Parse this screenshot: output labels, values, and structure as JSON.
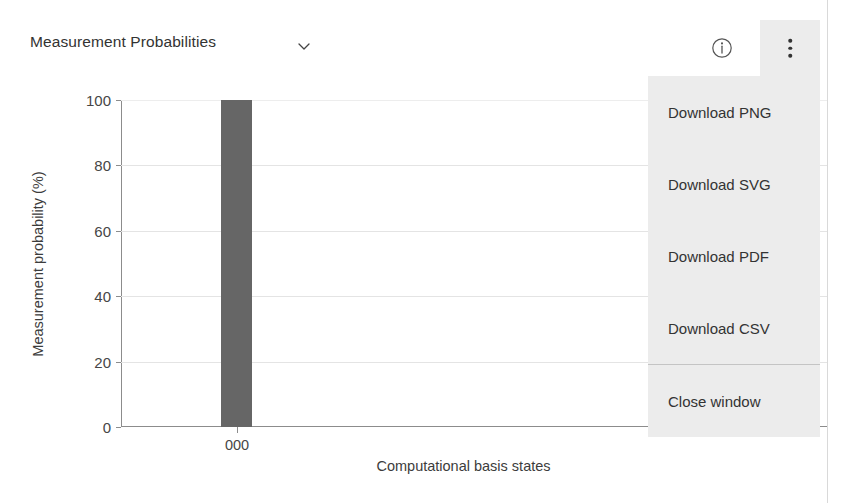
{
  "header": {
    "title": "Measurement Probabilities",
    "chevron_icon": "chevron-down-icon",
    "info_icon": "info-circle-icon",
    "kebab_icon": "more-vertical-icon"
  },
  "menu": {
    "items": [
      {
        "label": "Download PNG",
        "divider_after": false
      },
      {
        "label": "Download SVG",
        "divider_after": false
      },
      {
        "label": "Download PDF",
        "divider_after": false
      },
      {
        "label": "Download CSV",
        "divider_after": true
      },
      {
        "label": "Close window",
        "divider_after": false
      }
    ]
  },
  "chart_data": {
    "type": "bar",
    "title": "Measurement Probabilities",
    "categories": [
      "000"
    ],
    "values": [
      100
    ],
    "xlabel": "Computational basis states",
    "ylabel": "Measurement probability (%)",
    "ylim": [
      0,
      100
    ],
    "yticks": [
      0,
      20,
      40,
      60,
      80,
      100
    ],
    "yticklabels": [
      "0",
      "20",
      "40",
      "60",
      "80",
      "100"
    ],
    "grid": true,
    "legend": false,
    "bar_color": "#666666"
  },
  "colors": {
    "bar": "#666666",
    "menu_background": "#ececec",
    "axis": "#8c8c8c",
    "gridline": "#e4e4e4",
    "text": "#333333"
  }
}
